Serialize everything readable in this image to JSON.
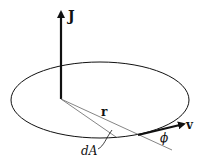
{
  "diagram": {
    "labels": {
      "angular_momentum": "J",
      "radius_vector": "r",
      "velocity": "v",
      "area_element": "dA",
      "angle": "ϕ"
    },
    "colors": {
      "stroke": "#111111",
      "thin_line": "#555555",
      "background": "#ffffff"
    }
  }
}
